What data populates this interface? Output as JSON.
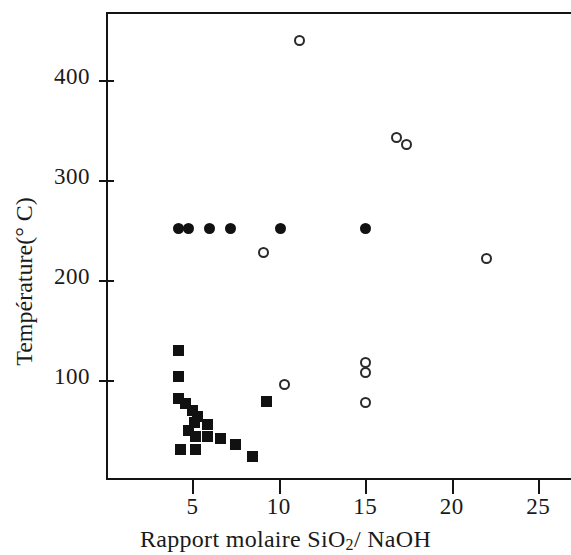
{
  "chart_data": {
    "type": "scatter",
    "title": "",
    "xlabel": "Rapport molaire SiO2/ NaOH",
    "xlabel_parts": {
      "pre": "Rapport molaire SiO",
      "sub": "2",
      "post": "/ NaOH"
    },
    "ylabel": "Température(° C)",
    "xlim": [
      0,
      26.9
    ],
    "ylim": [
      0,
      468
    ],
    "xticks": [
      5,
      10,
      15,
      20,
      25
    ],
    "yticks": [
      100,
      200,
      300,
      400
    ],
    "xtick_labels": [
      "5",
      "10",
      "15",
      "20",
      "25"
    ],
    "ytick_labels": [
      "100",
      "200",
      "300",
      "400"
    ],
    "grid": false,
    "legend": "none",
    "series": [
      {
        "name": "filled-circle",
        "marker": "filled-circle",
        "color": "#111111",
        "points": [
          {
            "x": 4.2,
            "y": 252
          },
          {
            "x": 4.8,
            "y": 252
          },
          {
            "x": 6.0,
            "y": 252
          },
          {
            "x": 7.2,
            "y": 252
          },
          {
            "x": 10.1,
            "y": 252
          },
          {
            "x": 15.0,
            "y": 252
          }
        ]
      },
      {
        "name": "open-circle",
        "marker": "open-circle",
        "color": "#2a2a2a",
        "points": [
          {
            "x": 11.2,
            "y": 440
          },
          {
            "x": 16.8,
            "y": 343
          },
          {
            "x": 17.4,
            "y": 336
          },
          {
            "x": 22.0,
            "y": 222
          },
          {
            "x": 9.1,
            "y": 228
          },
          {
            "x": 10.3,
            "y": 96
          },
          {
            "x": 15.0,
            "y": 118
          },
          {
            "x": 15.0,
            "y": 108
          },
          {
            "x": 15.0,
            "y": 78
          }
        ]
      },
      {
        "name": "filled-square",
        "marker": "filled-square",
        "color": "#111111",
        "points": [
          {
            "x": 4.2,
            "y": 130
          },
          {
            "x": 4.2,
            "y": 104
          },
          {
            "x": 4.2,
            "y": 82
          },
          {
            "x": 4.6,
            "y": 77
          },
          {
            "x": 5.0,
            "y": 70
          },
          {
            "x": 5.3,
            "y": 64
          },
          {
            "x": 5.1,
            "y": 58
          },
          {
            "x": 4.8,
            "y": 50
          },
          {
            "x": 5.2,
            "y": 44
          },
          {
            "x": 5.9,
            "y": 56
          },
          {
            "x": 5.9,
            "y": 44
          },
          {
            "x": 6.6,
            "y": 42
          },
          {
            "x": 4.3,
            "y": 31
          },
          {
            "x": 5.2,
            "y": 31
          },
          {
            "x": 7.5,
            "y": 36
          },
          {
            "x": 8.5,
            "y": 24
          },
          {
            "x": 9.3,
            "y": 79
          }
        ]
      }
    ]
  }
}
